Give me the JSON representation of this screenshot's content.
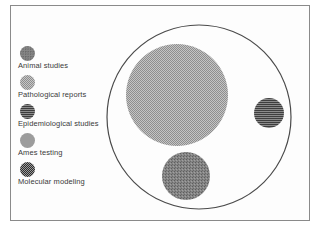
{
  "figure": {
    "legend": {
      "items": [
        {
          "label": "Animal studies",
          "pattern": "speckled",
          "color": "#7a7a7a"
        },
        {
          "label": "Pathological reports",
          "pattern": "checkered-fine",
          "color": "#a9a9a9"
        },
        {
          "label": "Epidemiological studies",
          "pattern": "horizontal-stripes",
          "color": "#5a5a5a"
        },
        {
          "label": "Ames testing",
          "pattern": "solid",
          "color": "#9a9a9a"
        },
        {
          "label": "Molecular modeling",
          "pattern": "dotted-dark",
          "color": "#4e4e4e"
        }
      ]
    },
    "boundary_circle": {
      "cx": 199,
      "cy": 117,
      "r": 92,
      "stroke": "#4a4a4a"
    },
    "circles": [
      {
        "legend_index": 1,
        "cx": 177,
        "cy": 95,
        "r": 51
      },
      {
        "legend_index": 2,
        "cx": 269,
        "cy": 113,
        "r": 15
      },
      {
        "legend_index": 0,
        "cx": 186,
        "cy": 176,
        "r": 24
      }
    ]
  }
}
